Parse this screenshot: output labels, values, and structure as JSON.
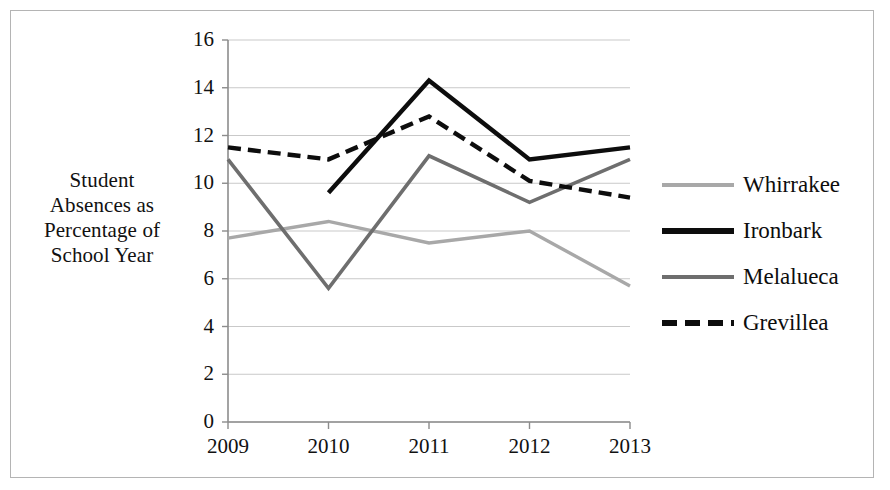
{
  "figure": {
    "y_axis_title": "Student Absences as Percentage of School Year",
    "y_axis_title_lines": [
      "Student",
      "Absences as",
      "Percentage of",
      "School Year"
    ]
  },
  "legend": {
    "position": "right",
    "items": [
      {
        "label": "Whirrakee",
        "color": "#a8a8a8",
        "style": "solid",
        "swatch_name": "legend-swatch-whirrakee"
      },
      {
        "label": "Ironbark",
        "color": "#0d0d0d",
        "style": "solid",
        "swatch_name": "legend-swatch-ironbark"
      },
      {
        "label": "Melalueca",
        "color": "#6e6e6e",
        "style": "solid",
        "swatch_name": "legend-swatch-melalueca"
      },
      {
        "label": "Grevillea",
        "color": "#0d0d0d",
        "style": "dashed",
        "swatch_name": "legend-swatch-grevillea"
      }
    ]
  },
  "axes": {
    "y_ticks": [
      "0",
      "2",
      "4",
      "6",
      "8",
      "10",
      "12",
      "14",
      "16"
    ],
    "x_ticks": [
      "2009",
      "2010",
      "2011",
      "2012",
      "2013"
    ]
  },
  "chart_data": {
    "type": "line",
    "title": "",
    "xlabel": "",
    "ylabel": "Student Absences as Percentage of School Year",
    "categories": [
      "2009",
      "2010",
      "2011",
      "2012",
      "2013"
    ],
    "x": [
      2009,
      2010,
      2011,
      2012,
      2013
    ],
    "ylim": [
      0,
      16
    ],
    "xlim": [
      2009,
      2013
    ],
    "ytick_step": 2,
    "grid": "horizontal",
    "legend_position": "right",
    "series": [
      {
        "name": "Whirrakee",
        "color": "#a8a8a8",
        "style": "solid",
        "values": [
          7.7,
          8.4,
          7.5,
          8.0,
          5.7
        ]
      },
      {
        "name": "Ironbark",
        "color": "#0d0d0d",
        "style": "solid",
        "values": [
          null,
          9.6,
          14.3,
          11.0,
          11.5
        ]
      },
      {
        "name": "Melalueca",
        "color": "#6e6e6e",
        "style": "solid",
        "values": [
          11.0,
          5.6,
          11.15,
          9.2,
          11.0
        ]
      },
      {
        "name": "Grevillea",
        "color": "#0d0d0d",
        "style": "dashed",
        "values": [
          11.5,
          11.0,
          12.8,
          10.1,
          9.4
        ]
      }
    ]
  }
}
